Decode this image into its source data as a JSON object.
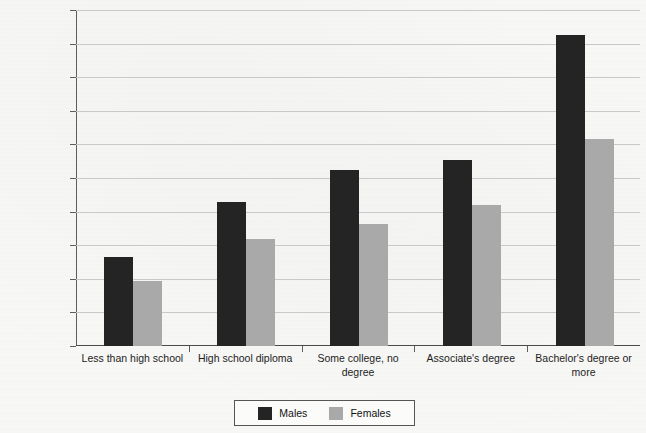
{
  "chart_data": {
    "type": "bar",
    "title": "",
    "xlabel": "",
    "ylabel": "Income",
    "categories": [
      "Less than high school",
      "High school diploma",
      "Some college, no degree",
      "Associate's degree",
      "Bachelor's degree or more"
    ],
    "series": [
      {
        "name": "Males",
        "color": "#242424",
        "values": [
          26500,
          43000,
          52300,
          55400,
          92500
        ]
      },
      {
        "name": "Females",
        "color": "#a9a9a9",
        "values": [
          19400,
          31800,
          36300,
          41900,
          61500
        ]
      }
    ],
    "ylim": [
      0,
      100000
    ],
    "ytick_values": [
      0,
      10000,
      20000,
      30000,
      40000,
      50000,
      60000,
      70000,
      80000,
      90000,
      100000
    ],
    "ytick_labels": [
      "$0",
      "$10,000",
      "$20,000",
      "$30,000",
      "$40,000",
      "$50,000",
      "$60,000",
      "$70,000",
      "$80,000",
      "$90,000",
      "$1,00,000"
    ],
    "grid": true,
    "legend_position": "bottom-center",
    "legend_entries": [
      "Males",
      "Females"
    ]
  }
}
